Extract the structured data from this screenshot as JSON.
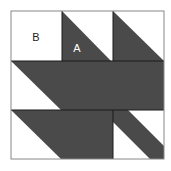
{
  "diagram": {
    "type": "quilt-block",
    "grid": "3x3",
    "labels": {
      "b": "B",
      "a": "A"
    },
    "colors": {
      "dark_fill": "#4a4a4a",
      "light_fill": "#ffffff",
      "outline": "#1a1a1a",
      "frame": "#888888",
      "label_dark": "#222222",
      "label_light": "#ffffff"
    }
  }
}
